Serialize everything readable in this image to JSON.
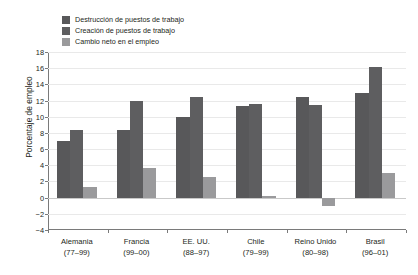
{
  "chart_data": {
    "type": "bar",
    "title": "",
    "xlabel": "",
    "ylabel": "Porcentaje de empleo",
    "ylim": [
      -4,
      18
    ],
    "ytick_step": 2,
    "yticks": [
      18,
      16,
      14,
      12,
      10,
      8,
      6,
      4,
      2,
      0,
      -2,
      -4
    ],
    "grid": true,
    "legend_position": "top-left",
    "categories": [
      "Alemania\n(77–99)",
      "Francia\n(99–00)",
      "EE. UU.\n(88–97)",
      "Chile\n(79–99)",
      "Reino Unido\n(80–98)",
      "Brasil\n(96–01)"
    ],
    "category_names": [
      "Alemania",
      "Francia",
      "EE. UU.",
      "Chile",
      "Reino Unido",
      "Brasil"
    ],
    "category_periods": [
      "(77–99)",
      "(99–00)",
      "(88–97)",
      "(79–99)",
      "(80–98)",
      "(96–01)"
    ],
    "series": [
      {
        "name": "Destrucción de puestos de trabajo",
        "color": "#58585a",
        "values": [
          7.0,
          8.3,
          10.0,
          11.3,
          12.5,
          12.9
        ]
      },
      {
        "name": "Creación de puestos de trabajo",
        "color": "#5e5e60",
        "values": [
          8.4,
          12.0,
          12.5,
          11.6,
          11.5,
          16.1
        ]
      },
      {
        "name": "Cambio neto en el empleo",
        "color": "#9a9a9c",
        "values": [
          1.3,
          3.7,
          2.5,
          0.2,
          -1.0,
          3.1
        ]
      }
    ]
  },
  "colors": {
    "series_1": "#58585a",
    "series_2": "#5e5e60",
    "series_3": "#9a9a9c",
    "axis": "#7a7a7a",
    "grid": "#e9e9e9",
    "text": "#231f20",
    "background": "#ffffff"
  }
}
